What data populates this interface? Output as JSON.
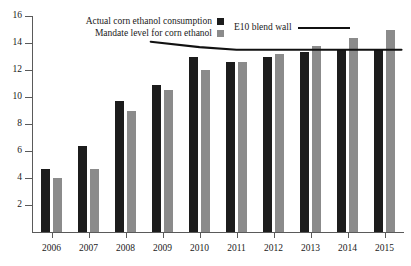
{
  "chart_data": {
    "type": "bar",
    "title": "",
    "xlabel": "",
    "ylabel": "",
    "categories": [
      "2006",
      "2007",
      "2008",
      "2009",
      "2010",
      "2011",
      "2012",
      "2013",
      "2014",
      "2015"
    ],
    "ylim": [
      0,
      16
    ],
    "yticks": [
      2,
      4,
      6,
      8,
      10,
      12,
      14,
      16
    ],
    "grid": false,
    "legend_position": "top",
    "series": [
      {
        "name": "Actual corn ethanol consumption",
        "type": "bar",
        "color": "#1c1c1c",
        "values": [
          4.7,
          6.4,
          9.7,
          10.9,
          13.0,
          12.6,
          13.0,
          13.3,
          13.5,
          13.5
        ]
      },
      {
        "name": "Mandate level for corn ethanol",
        "type": "bar",
        "color": "#8b8b8b",
        "values": [
          4.0,
          4.7,
          9.0,
          10.5,
          12.0,
          12.6,
          13.2,
          13.8,
          14.4,
          15.0
        ]
      },
      {
        "name": "E10 blend wall",
        "type": "line",
        "color": "#111111",
        "x": [
          "2009",
          "2010",
          "2011",
          "2012",
          "2013",
          "2014",
          "2015"
        ],
        "values": [
          14.1,
          13.7,
          13.5,
          13.5,
          13.5,
          13.5,
          13.5
        ]
      }
    ]
  },
  "legend": {
    "actual_label": "Actual corn ethanol consumption",
    "mandate_label": "Mandate level for corn ethanol",
    "blendwall_label": "E10 blend wall"
  },
  "axes": {
    "y_tick_labels": [
      "16",
      "14",
      "12",
      "10",
      "8",
      "6",
      "4",
      "2"
    ],
    "x_tick_labels": [
      "2006",
      "2007",
      "2008",
      "2009",
      "2010",
      "2011",
      "2012",
      "2013",
      "2014",
      "2015"
    ]
  }
}
